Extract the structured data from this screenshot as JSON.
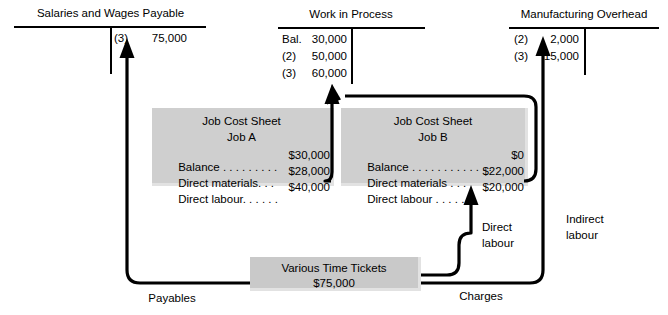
{
  "accounts": [
    {
      "id": "salaries_wages_payable",
      "title": "Salaries and Wages Payable",
      "credits": [
        {
          "ref": "(3)",
          "amount": "75,000"
        }
      ],
      "debits": []
    },
    {
      "id": "work_in_process",
      "title": "Work in Process",
      "debits": [
        {
          "ref": "Bal.",
          "amount": "30,000"
        },
        {
          "ref": "(2)",
          "amount": "50,000"
        },
        {
          "ref": "(3)",
          "amount": "60,000"
        }
      ],
      "credits": []
    },
    {
      "id": "manufacturing_overhead",
      "title": "Manufacturing Overhead",
      "debits": [
        {
          "ref": "(2)",
          "amount": "2,000"
        },
        {
          "ref": "(3)",
          "amount": "15,000"
        }
      ],
      "credits": []
    }
  ],
  "job_sheets": [
    {
      "id": "job_a",
      "heading": "Job Cost Sheet",
      "job": "Job A",
      "rows": [
        {
          "label": "Balance",
          "leader": " . . . . . . . . .",
          "amount": "$30,000"
        },
        {
          "label": "Direct materials",
          "leader": ". . .",
          "amount": "$28,000"
        },
        {
          "label": "Direct labour",
          "leader": ". . . . . .",
          "amount": "$40,000"
        }
      ]
    },
    {
      "id": "job_b",
      "heading": "Job Cost Sheet",
      "job": "Job B",
      "rows": [
        {
          "label": "Balance",
          "leader": " . . . . . . . . . . . . .",
          "amount": "$0"
        },
        {
          "label": "Direct materials",
          "leader": " . . .",
          "amount": "$22,000"
        },
        {
          "label": "Direct labour",
          "leader": " . . . . . .",
          "amount": "$20,000"
        }
      ]
    }
  ],
  "source_document": {
    "id": "various_time_tickets",
    "title": "Various Time Tickets",
    "amount": "$75,000"
  },
  "flow_labels": {
    "payables": "Payables",
    "charges": "Charges",
    "direct_labour": "Direct\nlabour",
    "direct_labour_line1": "Direct",
    "direct_labour_line2": "labour",
    "indirect_labour_line1": "Indirect",
    "indirect_labour_line2": "labour"
  },
  "colors": {
    "ink": "#000000",
    "box_fill": "#c9c9c9",
    "box_shadow": "#e2e2e2",
    "page": "#ffffff"
  }
}
